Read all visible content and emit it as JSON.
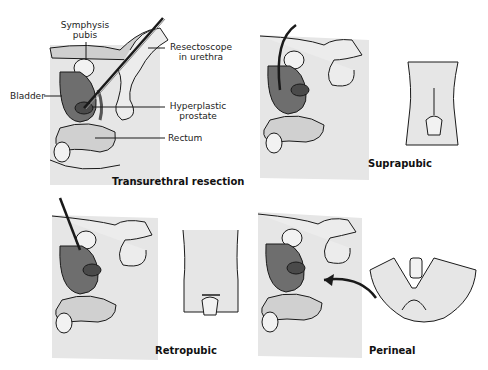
{
  "figure": {
    "panels": [
      {
        "id": "transurethral",
        "caption": "Transurethral resection",
        "labels": {
          "symphysis": "Symphysis\npubis",
          "symphysis_line1": "Symphysis",
          "symphysis_line2": "pubis",
          "resectoscope_line1": "Resectoscope",
          "resectoscope_line2": "in urethra",
          "bladder": "Bladder",
          "prostate_line1": "Hyperplastic",
          "prostate_line2": "prostate",
          "rectum": "Rectum"
        }
      },
      {
        "id": "suprapubic",
        "caption": "Suprapubic"
      },
      {
        "id": "retropubic",
        "caption": "Retropubic"
      },
      {
        "id": "perineal",
        "caption": "Perineal"
      }
    ],
    "colors": {
      "background": "#ffffff",
      "tissue_light": "#e6e6e6",
      "tissue_mid": "#bdbdbd",
      "bladder_dark": "#6e6e6e",
      "prostate_dark": "#4a4a4a",
      "outline": "#1a1a1a"
    }
  }
}
